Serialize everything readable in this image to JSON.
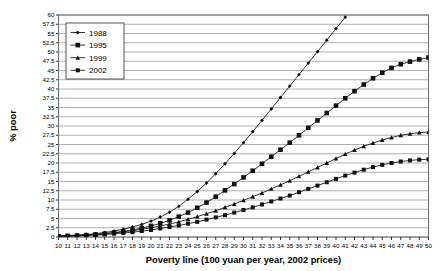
{
  "chart_data": {
    "type": "line",
    "title": "",
    "xlabel": "Poverty line (100 yuan per year, 2002 prices)",
    "ylabel": "% poor",
    "xlim": [
      10,
      50
    ],
    "ylim": [
      0,
      60
    ],
    "ytick_step": 2.5,
    "xtick_step": 1,
    "grid": "horizontal",
    "legend_position": "top-left-inside",
    "x": [
      10,
      11,
      12,
      13,
      14,
      15,
      16,
      17,
      18,
      19,
      20,
      21,
      22,
      23,
      24,
      25,
      26,
      27,
      28,
      29,
      30,
      31,
      32,
      33,
      34,
      35,
      36,
      37,
      38,
      39,
      40,
      41,
      42,
      43,
      44,
      45,
      46,
      47,
      48,
      49,
      50
    ],
    "xticklabels": [
      "10",
      "11",
      "12",
      "13",
      "14",
      "15",
      "16",
      "17",
      "18",
      "19",
      "20",
      "21",
      "22",
      "23",
      "24",
      "25",
      "26",
      "27",
      "28",
      "29",
      "30",
      "31",
      "32",
      "33",
      "34",
      "35",
      "36",
      "37",
      "38",
      "39",
      "40",
      "41",
      "42",
      "43",
      "44",
      "45",
      "46",
      "47",
      "48",
      "49",
      "50"
    ],
    "yticklabels": [
      "0",
      "2.5",
      "5",
      "7.5",
      "10",
      "12.5",
      "15",
      "17.5",
      "20",
      "22.5",
      "25",
      "27.5",
      "30",
      "32.5",
      "35",
      "37.5",
      "40",
      "42.5",
      "45",
      "47.5",
      "50",
      "52.5",
      "55",
      "57.5",
      "60"
    ],
    "series": [
      {
        "name": "1988",
        "marker": "diamond",
        "values": [
          0.3,
          0.4,
          0.5,
          0.7,
          0.9,
          1.2,
          1.6,
          2.1,
          2.7,
          3.4,
          4.3,
          5.4,
          6.7,
          8.3,
          10.2,
          12.3,
          14.6,
          17.1,
          19.8,
          22.6,
          25.5,
          28.5,
          31.5,
          34.6,
          37.7,
          40.8,
          43.9,
          47.0,
          50.1,
          53.2,
          56.3,
          59.4,
          null,
          null,
          null,
          null,
          null,
          null,
          null,
          null,
          null
        ]
      },
      {
        "name": "1995",
        "marker": "square",
        "values": [
          0.2,
          0.3,
          0.4,
          0.5,
          0.7,
          0.9,
          1.2,
          1.5,
          1.9,
          2.4,
          3.0,
          3.7,
          4.5,
          5.5,
          6.6,
          7.9,
          9.3,
          10.9,
          12.6,
          14.3,
          16.1,
          17.9,
          19.8,
          21.7,
          23.6,
          25.5,
          27.5,
          29.5,
          31.5,
          33.5,
          35.5,
          37.5,
          39.4,
          41.2,
          42.9,
          44.4,
          45.7,
          46.7,
          47.4,
          48.0,
          48.5
        ]
      },
      {
        "name": "1999",
        "marker": "triangle",
        "values": [
          0.2,
          0.3,
          0.4,
          0.5,
          0.7,
          0.9,
          1.1,
          1.4,
          1.7,
          2.1,
          2.5,
          3.0,
          3.5,
          4.1,
          4.8,
          5.5,
          6.3,
          7.1,
          8.0,
          8.9,
          9.9,
          10.9,
          11.9,
          13.0,
          14.1,
          15.2,
          16.4,
          17.6,
          18.8,
          20.0,
          21.2,
          22.4,
          23.5,
          24.5,
          25.4,
          26.2,
          26.9,
          27.5,
          27.9,
          28.2,
          28.4
        ]
      },
      {
        "name": "2002",
        "marker": "square-small",
        "values": [
          0.2,
          0.2,
          0.3,
          0.4,
          0.5,
          0.7,
          0.9,
          1.1,
          1.3,
          1.6,
          1.9,
          2.3,
          2.7,
          3.1,
          3.6,
          4.1,
          4.7,
          5.3,
          5.9,
          6.6,
          7.3,
          8.0,
          8.8,
          9.6,
          10.4,
          11.2,
          12.1,
          13.0,
          13.9,
          14.8,
          15.7,
          16.6,
          17.4,
          18.2,
          18.9,
          19.5,
          20.0,
          20.4,
          20.7,
          20.9,
          21.0
        ]
      }
    ]
  },
  "legend": {
    "entries": [
      {
        "label": "1988"
      },
      {
        "label": "1995"
      },
      {
        "label": "1999"
      },
      {
        "label": "2002"
      }
    ]
  }
}
